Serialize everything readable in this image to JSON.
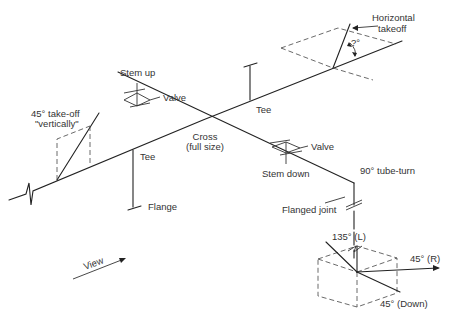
{
  "diagram": {
    "labels": {
      "horizontal_takeoff_1": "Horizontal",
      "horizontal_takeoff_2": "takeoff",
      "angle": "?°",
      "stem_up": "Stem up",
      "valve_upper": "Valve",
      "takeoff_45_1": "45° take-off",
      "takeoff_45_2": "\"vertically\"",
      "tee_upper": "Tee",
      "tee_lower": "Tee",
      "cross_1": "Cross",
      "cross_2": "(full size)",
      "valve_lower": "Valve",
      "stem_down": "Stem down",
      "tube_turn": "90° tube-turn",
      "flange": "Flange",
      "flanged_joint": "Flanged joint",
      "view": "View",
      "angle_135_l": "135° (L)",
      "angle_45_r": "45° (R)",
      "angle_45_down": "45° (Down)"
    }
  }
}
